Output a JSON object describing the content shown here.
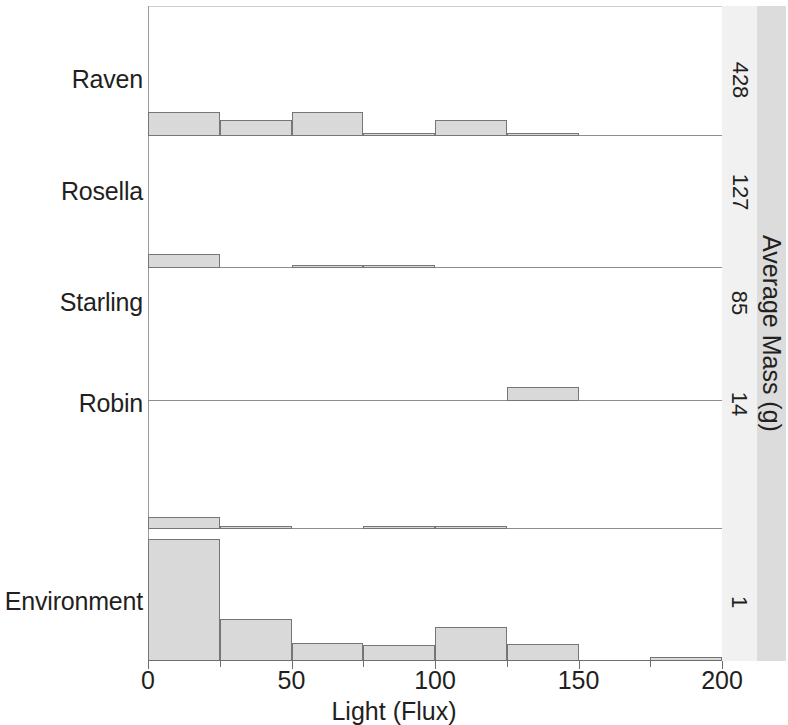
{
  "chart_data": {
    "type": "bar",
    "title": "",
    "xlabel": "Light (Flux)",
    "ylabel": "",
    "strip_label": "Average Mass (g)",
    "xlim": [
      0,
      200
    ],
    "xticks": [
      0,
      50,
      100,
      150,
      200
    ],
    "xticklabels": [
      "0",
      "50",
      "100",
      "150",
      "200"
    ],
    "grid": false,
    "legend": "none",
    "bin_width": 25,
    "bin_starts": [
      0,
      25,
      50,
      75,
      100,
      125,
      150,
      175
    ],
    "panels": [
      {
        "category": "Raven",
        "strip_value": "428",
        "label_y": 80,
        "baseline_y": 135,
        "values": [
          24,
          16,
          24,
          3,
          16,
          3,
          0,
          0
        ]
      },
      {
        "category": "Rosella",
        "strip_value": "127",
        "label_y": 192,
        "baseline_y": 267,
        "values": [
          14,
          0,
          3,
          3,
          0,
          0,
          0,
          0
        ]
      },
      {
        "category": "Starling",
        "strip_value": "85",
        "label_y": 303,
        "baseline_y": 400,
        "values": [
          0,
          0,
          0,
          0,
          0,
          14,
          0,
          0
        ]
      },
      {
        "category": "Robin",
        "strip_value": "14",
        "label_y": 404,
        "baseline_y": 528,
        "values": [
          12,
          3,
          0,
          3,
          3,
          0,
          0,
          0
        ]
      },
      {
        "category": "Environment",
        "strip_value": "1",
        "label_y": 602,
        "baseline_y": 660,
        "values": [
          122,
          42,
          18,
          16,
          34,
          17,
          0,
          4
        ]
      }
    ]
  }
}
